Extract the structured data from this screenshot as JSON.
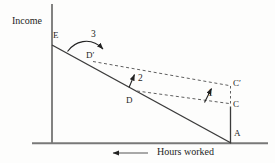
{
  "diagram": {
    "y_axis_label": "Income",
    "x_axis_label": "Hours worked",
    "points": {
      "e": "E",
      "d_prime": "D′",
      "d": "D",
      "c_prime": "C′",
      "c": "C",
      "a": "A"
    },
    "step_labels": {
      "one": "1",
      "two": "2",
      "three": "3"
    },
    "colors": {
      "background": "#fdfdfc",
      "solid_line": "#3b3b3b",
      "dashed_line": "#5f5f5f",
      "axis": "#787878",
      "arrow": "#222222",
      "text": "#1d1d1d"
    }
  }
}
